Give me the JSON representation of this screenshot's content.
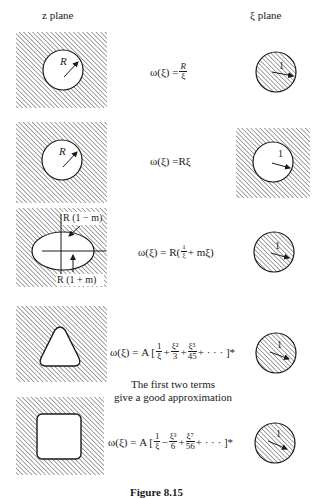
{
  "headers": {
    "z_plane": "z plane",
    "xi_plane": "ξ plane"
  },
  "rows": [
    {
      "z_shape": "circle-hole",
      "z_label": "R",
      "formula": {
        "lhs": "ω(ξ) = ",
        "parts": [
          "R",
          "ξ"
        ]
      },
      "xi_shape": "hatched-disk",
      "xi_label": "1"
    },
    {
      "z_shape": "circle-hole",
      "z_label": "R",
      "formula": {
        "lhs": "ω(ξ) = ",
        "text": "Rξ"
      },
      "xi_shape": "hole-in-plane",
      "xi_label": "1"
    },
    {
      "z_shape": "ellipse-hole",
      "z_labels": [
        "R (1 − m)",
        "R (1 + m)"
      ],
      "formula": {
        "lhs": "ω(ξ) = R(",
        "num": "1",
        "den": "ξ",
        "rest": " + mξ)"
      },
      "xi_shape": "hatched-disk",
      "xi_label": "1"
    },
    {
      "z_shape": "rounded-triangle-hole",
      "formula": {
        "lhs": "ω(ξ) = A [",
        "terms": [
          {
            "num": "1",
            "den": "ξ"
          },
          {
            "op": "+",
            "num": "ξ²",
            "den": "3"
          },
          {
            "op": "+",
            "num": "ξ⁵",
            "den": "45"
          }
        ],
        "tail": " + · · · ]*"
      },
      "xi_shape": "hatched-disk",
      "xi_label": "1"
    },
    {
      "z_shape": "rounded-square-hole",
      "formula": {
        "lhs": "ω(ξ) = A [",
        "terms": [
          {
            "num": "1",
            "den": "ξ"
          },
          {
            "op": "−",
            "num": "ξ³",
            "den": "6"
          },
          {
            "op": "+",
            "num": "ξ⁷",
            "den": "56"
          }
        ],
        "tail": " + · · · ]*"
      },
      "xi_shape": "hatched-disk",
      "xi_label": "1"
    }
  ],
  "note": {
    "line1": "The first two terms",
    "line2": "give a good approximation"
  },
  "caption": "Figure 8.15"
}
